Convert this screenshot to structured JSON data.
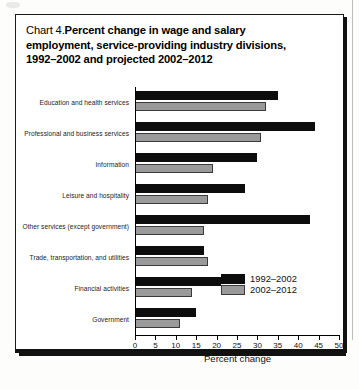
{
  "figure": {
    "label_prefix": "Chart 4.",
    "title_line_1": "Percent change in wage and salary",
    "title_line_2": "employment, service-providing industry divisions,",
    "title_line_3": "1992–2002 and projected 2002–2012"
  },
  "colors": {
    "series_a": "#0d0d0d",
    "series_b": "#9a9a9a",
    "axis": "#000000",
    "frame": "#111111",
    "background": "#ffffff"
  },
  "chart_data": {
    "type": "bar",
    "orientation": "horizontal",
    "xlabel": "Percent change",
    "ylabel": "",
    "xlim": [
      0,
      50
    ],
    "xticks": [
      0,
      5,
      10,
      15,
      20,
      25,
      30,
      35,
      40,
      45,
      50
    ],
    "xtick_labels": [
      "0",
      "5",
      "10",
      "15",
      "20",
      "25",
      "30",
      "35",
      "40",
      "45",
      "50"
    ],
    "grid": false,
    "legend_position": "lower-right",
    "categories": [
      "Education and health services",
      "Professional and business services",
      "Information",
      "Leisure and hospitality",
      "Other services (except government)",
      "Trade, transportation, and utilities",
      "Financial activities",
      "Government"
    ],
    "series": [
      {
        "name": "1992–2002",
        "color": "#0d0d0d",
        "values": [
          35,
          44,
          30,
          27,
          43,
          17,
          21,
          15
        ]
      },
      {
        "name": "2002–2012",
        "color": "#9a9a9a",
        "values": [
          32,
          31,
          19,
          18,
          17,
          18,
          14,
          11
        ]
      }
    ]
  }
}
